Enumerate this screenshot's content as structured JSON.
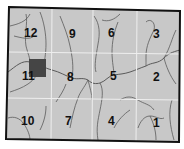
{
  "map": {
    "type": "zoned-grid-map",
    "background_color": "#c8c8c8",
    "border_color": "#111111",
    "grid_color": "#ececec",
    "river_color": "#555555",
    "columns": 4,
    "rows": 3,
    "zones": [
      {
        "label": "12",
        "row": 0,
        "col": 0
      },
      {
        "label": "9",
        "row": 0,
        "col": 1
      },
      {
        "label": "6",
        "row": 0,
        "col": 2
      },
      {
        "label": "3",
        "row": 0,
        "col": 3
      },
      {
        "label": "11",
        "row": 1,
        "col": 0
      },
      {
        "label": "8",
        "row": 1,
        "col": 1
      },
      {
        "label": "5",
        "row": 1,
        "col": 2
      },
      {
        "label": "2",
        "row": 1,
        "col": 3
      },
      {
        "label": "10",
        "row": 2,
        "col": 0
      },
      {
        "label": "7",
        "row": 2,
        "col": 1
      },
      {
        "label": "4",
        "row": 2,
        "col": 2
      },
      {
        "label": "1",
        "row": 2,
        "col": 3
      }
    ],
    "marker": {
      "zone": "11",
      "shape": "square",
      "color": "#444444"
    }
  }
}
